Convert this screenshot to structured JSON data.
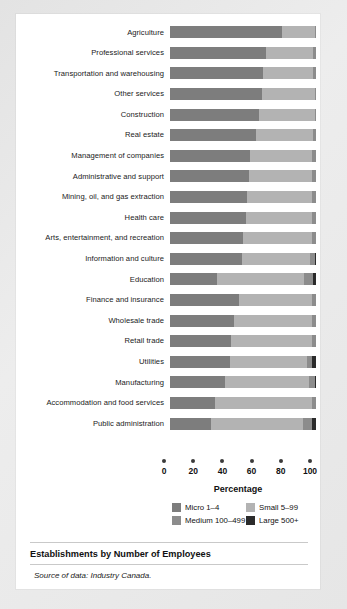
{
  "chart_data": {
    "type": "bar",
    "orientation": "horizontal",
    "stacked": true,
    "title": "Establishments by Number of Employees",
    "source": "Source of data: Industry Canada.",
    "xlabel": "Percentage",
    "ylabel": "",
    "xlim": [
      0,
      100
    ],
    "xticks": [
      0,
      20,
      40,
      60,
      80,
      100
    ],
    "grid": false,
    "legend_position": "bottom",
    "categories": [
      "Agriculture",
      "Professional services",
      "Transportation and warehousing",
      "Other services",
      "Construction",
      "Real estate",
      "Management of companies",
      "Administrative and support",
      "Mining, oil, and gas extraction",
      "Health care",
      "Arts, entertainment, and recreation",
      "Information and culture",
      "Education",
      "Finance and insurance",
      "Wholesale trade",
      "Retail trade",
      "Utilities",
      "Manufacturing",
      "Accommodation and food services",
      "Public administration"
    ],
    "series": [
      {
        "name": "Micro 1–4",
        "color": "#7d7d7d",
        "values": [
          77,
          66,
          64,
          63,
          61,
          59,
          55,
          54,
          53,
          52,
          50,
          49,
          32,
          47,
          44,
          42,
          41,
          38,
          31,
          28
        ]
      },
      {
        "name": "Small 5–99",
        "color": "#b3b3b3",
        "values": [
          22,
          32,
          34,
          36,
          38,
          39,
          42,
          43,
          44,
          45,
          47,
          47,
          60,
          50,
          53,
          55,
          53,
          57,
          66,
          63
        ]
      },
      {
        "name": "Medium 100–499",
        "color": "#8c8c8c",
        "values": [
          1,
          2,
          2,
          1,
          1,
          2,
          3,
          3,
          3,
          3,
          3,
          3.5,
          6,
          3,
          3,
          3,
          3,
          4.5,
          3,
          6
        ]
      },
      {
        "name": "Large 500+",
        "color": "#2b2b2b",
        "values": [
          0,
          0,
          0,
          0,
          0,
          0,
          0,
          0,
          0,
          0,
          0,
          0.5,
          2,
          0,
          0,
          0,
          3,
          0.5,
          0,
          3
        ]
      }
    ],
    "legend": [
      {
        "label": "Micro 1–4",
        "color": "#7d7d7d"
      },
      {
        "label": "Small 5–99",
        "color": "#b3b3b3"
      },
      {
        "label": "Medium 100–499",
        "color": "#8c8c8c"
      },
      {
        "label": "Large 500+",
        "color": "#2b2b2b"
      }
    ]
  }
}
